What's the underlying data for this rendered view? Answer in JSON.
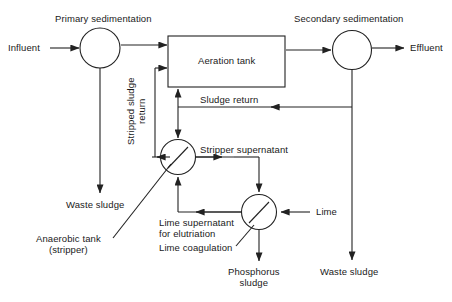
{
  "diagram": {
    "type": "process-flow",
    "stroke_color": "#222222",
    "background_color": "#ffffff",
    "nodes": {
      "primary_sedimentation": "Primary sedimentation",
      "aeration_tank": "Aeration tank",
      "secondary_sedimentation": "Secondary sedimentation",
      "anaerobic_tank": "Anaerobic tank\n(stripper)",
      "lime_coagulation": "Lime coagulation"
    },
    "streams": {
      "influent": "Influent",
      "effluent": "Effluent",
      "stripped_sludge_return": "Stripped sludge\nreturn",
      "sludge_return": "Sludge return",
      "stripper_supernatant": "Stripper supernatant",
      "lime_supernatant": "Lime supernatant\nfor elutriation",
      "lime": "Lime",
      "waste_sludge_primary": "Waste sludge",
      "waste_sludge_secondary": "Waste sludge",
      "phosphorus_sludge": "Phosphorus\nsludge"
    }
  }
}
